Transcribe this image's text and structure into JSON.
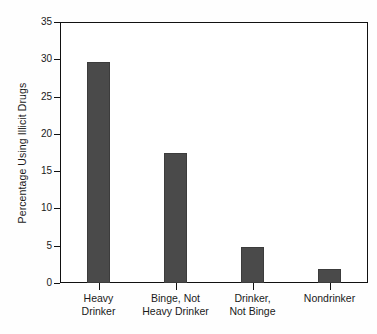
{
  "chart_data": {
    "type": "bar",
    "title": "",
    "xlabel": "",
    "ylabel": "Percentage Using Illicit Drugs",
    "categories": [
      "Heavy\nDrinker",
      "Binge, Not\nHeavy Drinker",
      "Drinker,\nNot Binge",
      "Nondrinker"
    ],
    "values": [
      29.7,
      17.5,
      4.8,
      1.9
    ],
    "ylim": [
      0,
      35
    ],
    "yticks": [
      0,
      5,
      10,
      15,
      20,
      25,
      30,
      35
    ],
    "ytick_labels": [
      "0",
      "5",
      "10",
      "15",
      "20",
      "25",
      "30",
      "35"
    ],
    "grid": false,
    "legend": null,
    "bar_color": "#4a4a4a",
    "axis_color": "#111111",
    "background_color": "#ffffff"
  }
}
